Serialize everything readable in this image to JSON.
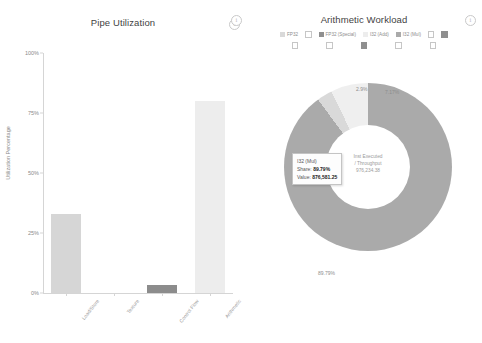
{
  "left_chart": {
    "title": "Pipe Utilization",
    "info_icon": "info-icon",
    "y_axis_label": "Utilization Percentage",
    "y_ticks": [
      "0%",
      "25%",
      "50%",
      "75%",
      "100%"
    ]
  },
  "right_chart": {
    "title": "Arithmetic Workload",
    "info_icon_left": "info-icon",
    "info_icon_right": "info-icon",
    "center_label_line1": "Inst Executed",
    "center_label_line2": "/ Throughput",
    "center_value": "976,234.38",
    "legend": [
      {
        "label": "FP32",
        "color": "#d9d9d9",
        "checked": false
      },
      {
        "label": "FP32 (Special)",
        "color": "#8f8f8f",
        "checked": true
      },
      {
        "label": "I32 (Add)",
        "color": "#ededed",
        "checked": false
      },
      {
        "label": "I32 (Mul)",
        "color": "#aaaaaa",
        "checked": false
      }
    ],
    "tooltip": {
      "name": "I32 (Mul)",
      "share_label": "Share:",
      "share_value": "89.79%",
      "value_label": "Value:",
      "value_value": "876,581.25"
    }
  },
  "chart_data": [
    {
      "type": "bar",
      "title": "Pipe Utilization",
      "xlabel": "",
      "ylabel": "Utilization Percentage",
      "ylim": [
        0,
        100
      ],
      "yticks": [
        0,
        25,
        50,
        75,
        100
      ],
      "ytick_labels": [
        "0%",
        "25%",
        "50%",
        "75%",
        "100%"
      ],
      "grid": false,
      "categories": [
        "Load/Store",
        "Texture",
        "Control Flow",
        "Arithmetic"
      ],
      "values": [
        33.0,
        0.0,
        3.2,
        80.0
      ],
      "bar_colors": [
        "#d6d6d6",
        "#eeeeee",
        "#8c8c8c",
        "#ededed"
      ]
    },
    {
      "type": "pie",
      "title": "Arithmetic Workload",
      "donut": true,
      "legend_position": "top",
      "center_annotation": "Inst Executed / Throughput 976,234.38",
      "labels": [
        "I32 (Mul)",
        "FP32 (Special)",
        "I32 (Add)"
      ],
      "values": [
        89.79,
        2.99,
        7.17
      ],
      "value_labels": [
        "89.79%",
        "2.9%",
        "7.17%"
      ],
      "colors": [
        "#aaaaaa",
        "#d9d9d9",
        "#efefef"
      ],
      "absolute_values": [
        876581.25,
        null,
        null
      ]
    }
  ]
}
